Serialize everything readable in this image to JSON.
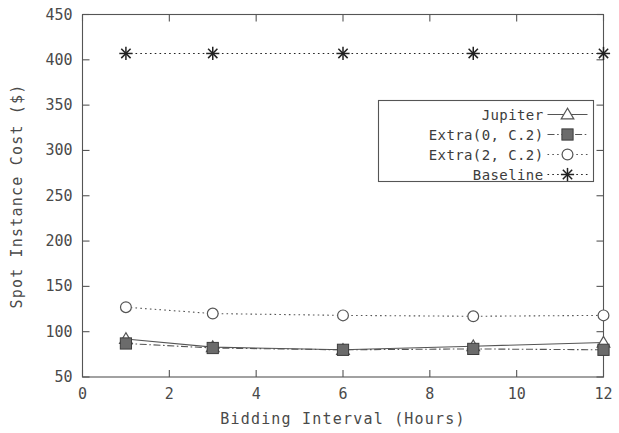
{
  "chart_data": {
    "type": "line",
    "title": "",
    "xlabel": "Bidding Interval (Hours)",
    "ylabel": "Spot Instance Cost ($)",
    "x": [
      1,
      3,
      6,
      9,
      12
    ],
    "xlim": [
      0,
      12
    ],
    "ylim": [
      50,
      450
    ],
    "xticks": [
      0,
      2,
      4,
      6,
      8,
      10,
      12
    ],
    "yticks": [
      50,
      100,
      150,
      200,
      250,
      300,
      350,
      400,
      450
    ],
    "xtick_labels": [
      "0",
      "2",
      "4",
      "6",
      "8",
      "10",
      "12"
    ],
    "ytick_labels": [
      "50",
      "100",
      "150",
      "200",
      "250",
      "300",
      "350",
      "400",
      "450"
    ],
    "grid": false,
    "legend_position": "upper right",
    "series": [
      {
        "name": "Jupiter",
        "marker": "triangle-open",
        "linestyle": "solid",
        "color": "#555555",
        "values": [
          92,
          83,
          80,
          84,
          88
        ]
      },
      {
        "name": "Extra(0, C.2)",
        "marker": "square-filled",
        "linestyle": "dashdot",
        "color": "#555555",
        "values": [
          87,
          82,
          80,
          81,
          80
        ]
      },
      {
        "name": "Extra(2, C.2)",
        "marker": "circle-open",
        "linestyle": "dotted",
        "color": "#555555",
        "values": [
          127,
          120,
          118,
          117,
          118
        ]
      },
      {
        "name": "Baseline",
        "marker": "asterisk",
        "linestyle": "dotted",
        "color": "#222222",
        "values": [
          407,
          407,
          407,
          407,
          407
        ]
      }
    ]
  },
  "axes": {
    "x_title": "Bidding Interval (Hours)",
    "y_title": "Spot Instance Cost ($)"
  },
  "legend": {
    "entries": [
      {
        "label": "Jupiter"
      },
      {
        "label": "Extra(0, C.2)"
      },
      {
        "label": "Extra(2, C.2)"
      },
      {
        "label": "Baseline"
      }
    ]
  }
}
